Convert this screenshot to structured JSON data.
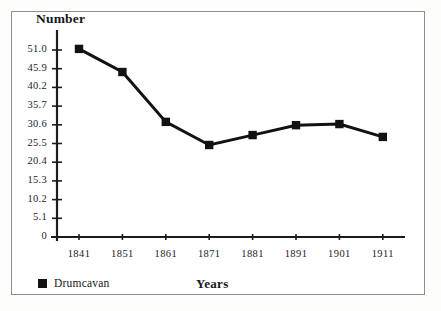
{
  "chart_data": {
    "type": "line",
    "title": "",
    "ylabel": "Number",
    "xlabel": "Years",
    "categories": [
      "1841",
      "1851",
      "1861",
      "1871",
      "1881",
      "1891",
      "1901",
      "1911"
    ],
    "series": [
      {
        "name": "Drumcavan",
        "marker": "filled-square",
        "color": "#111214",
        "values": [
          51.3,
          45.0,
          31.4,
          25.1,
          27.8,
          30.5,
          30.8,
          27.3
        ]
      }
    ],
    "ytick_labels": [
      "51.0",
      "45.9",
      "40.2",
      "35.7",
      "30.6",
      "25.5",
      "20.4",
      "15.3",
      "10.2",
      "5.1",
      "0"
    ],
    "ytick_values": [
      51.0,
      45.9,
      40.2,
      35.7,
      30.6,
      25.5,
      20.4,
      15.3,
      10.2,
      5.1,
      0
    ],
    "ylim": [
      0,
      54
    ],
    "grid": false,
    "legend_position": "bottom-left",
    "legend_entries": [
      "Drumcavan"
    ]
  },
  "axes": {
    "y_title": "Number",
    "x_title": "Years"
  },
  "legend": {
    "label": "Drumcavan",
    "swatch_color": "#111214"
  },
  "colors": {
    "line": "#111214",
    "marker": "#111214",
    "axis": "#1a1b1e",
    "frame": "#8d8d8d",
    "background": "#ffffff"
  }
}
